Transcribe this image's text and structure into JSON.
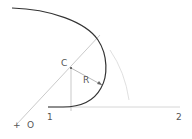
{
  "diagram": {
    "labels": {
      "center": "C",
      "radius": "R",
      "origin_marker": "+",
      "origin": "O",
      "point1": "1",
      "point2": "2"
    },
    "colors": {
      "curve": "#333333",
      "construction": "#bbbbbb",
      "faint_arc": "#d8d8d8",
      "text": "#555555"
    }
  }
}
